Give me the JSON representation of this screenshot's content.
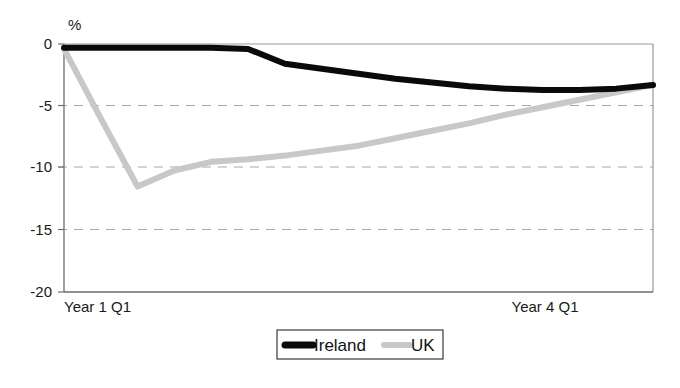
{
  "chart_data": {
    "type": "line",
    "title": "",
    "subtitle": "",
    "xlabel": "",
    "ylabel": "%",
    "ylim": [
      -20,
      0
    ],
    "yticks": [
      0,
      -5,
      -10,
      -15,
      -20
    ],
    "ytick_labels": [
      "0",
      "-5",
      "-10",
      "-15",
      "-20"
    ],
    "grid": "horizontal-dashed",
    "gridlines_at": [
      -5,
      -10,
      -15
    ],
    "x_tick_labels": [
      "Year 1 Q1",
      "Year 4 Q1"
    ],
    "x_tick_positions": [
      0,
      12
    ],
    "x_points": 17,
    "legend_position": "bottom-center",
    "series": [
      {
        "name": "Ireland",
        "color": "#0a0a0a",
        "style": "thick-solid",
        "values": [
          -0.3,
          -0.3,
          -0.3,
          -0.3,
          -0.3,
          -0.4,
          -1.6,
          -2.0,
          -2.4,
          -2.8,
          -3.1,
          -3.4,
          -3.6,
          -3.7,
          -3.7,
          -3.6,
          -3.3
        ]
      },
      {
        "name": "UK",
        "color": "#c8c8c8",
        "style": "thick-solid-light",
        "values": [
          -0.4,
          -6.0,
          -11.5,
          -10.2,
          -9.5,
          -9.3,
          -9.0,
          -8.6,
          -8.2,
          -7.6,
          -7.0,
          -6.4,
          -5.7,
          -5.1,
          -4.5,
          -3.9,
          -3.3
        ]
      }
    ]
  },
  "axis": {
    "unit_label": "%",
    "tick_0": "0",
    "tick_1": "-5",
    "tick_2": "-10",
    "tick_3": "-15",
    "tick_4": "-20",
    "x_label_left": "Year 1 Q1",
    "x_label_right": "Year 4 Q1"
  },
  "legend": {
    "items": [
      {
        "label": "Ireland",
        "color": "#0a0a0a"
      },
      {
        "label": "UK",
        "color": "#c8c8c8"
      }
    ]
  },
  "colors": {
    "ireland": "#0a0a0a",
    "uk": "#c8c8c8",
    "axis": "#8a8a8a",
    "grid": "#b0b0b0",
    "text": "#1a1a1a"
  }
}
